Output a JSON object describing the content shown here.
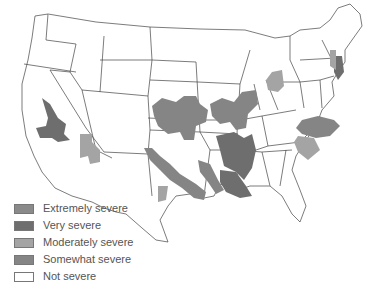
{
  "map": {
    "subject": "United States drought severity by region",
    "regions_highlighted": [
      {
        "area": "southeastern California / western Arizona",
        "severity": "Very severe"
      },
      {
        "area": "southern Arizona",
        "severity": "Moderately severe"
      },
      {
        "area": "Kansas / southern Nebraska",
        "severity": "Somewhat severe"
      },
      {
        "area": "Missouri / Iowa",
        "severity": "Somewhat severe"
      },
      {
        "area": "Oklahoma / north Texas band",
        "severity": "Somewhat severe"
      },
      {
        "area": "Arkansas / Mississippi valley",
        "severity": "Very severe"
      },
      {
        "area": "Louisiana",
        "severity": "Very severe"
      },
      {
        "area": "southeast Texas",
        "severity": "Moderately severe"
      },
      {
        "area": "Indiana / Ohio",
        "severity": "Moderately severe"
      },
      {
        "area": "New Jersey",
        "severity": "Very severe"
      },
      {
        "area": "eastern Pennsylvania",
        "severity": "Moderately severe"
      },
      {
        "area": "North Carolina",
        "severity": "Somewhat severe"
      },
      {
        "area": "South Carolina",
        "severity": "Moderately severe"
      }
    ]
  },
  "legend": {
    "items": [
      {
        "label": "Extremely severe",
        "color": "#8a8a8a"
      },
      {
        "label": "Very severe",
        "color": "#6e6e6e"
      },
      {
        "label": "Moderately severe",
        "color": "#a4a4a4"
      },
      {
        "label": "Somewhat severe",
        "color": "#858585"
      },
      {
        "label": "Not severe",
        "color": "#ffffff"
      }
    ]
  }
}
